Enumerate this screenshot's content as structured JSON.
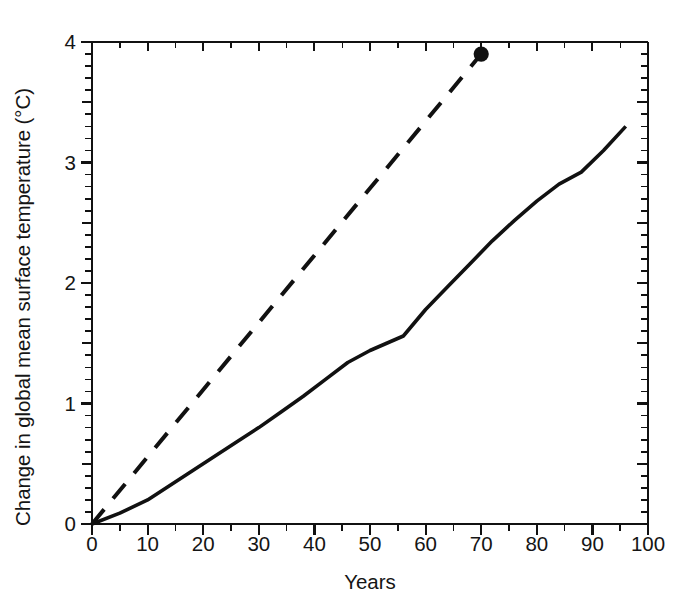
{
  "chart_data": {
    "type": "line",
    "title": "",
    "xlabel": "Years",
    "ylabel": "Change in global mean surface temperature (°C)",
    "xlim": [
      0,
      100
    ],
    "ylim": [
      0,
      4
    ],
    "xticks": [
      0,
      10,
      20,
      30,
      40,
      50,
      60,
      70,
      80,
      90,
      100
    ],
    "yticks": [
      0,
      1,
      2,
      3,
      4
    ],
    "xtick_labels": [
      "0",
      "10",
      "20",
      "30",
      "40",
      "50",
      "60",
      "70",
      "80",
      "90",
      "100"
    ],
    "ytick_labels": [
      "0",
      "1",
      "2",
      "3",
      "4"
    ],
    "x_minor_step": 5,
    "y_minor_step": 0.1,
    "grid": false,
    "legend": "none",
    "frame": "box",
    "line_color": "#111111",
    "background_color": "#ffffff",
    "series": [
      {
        "name": "dashed-projection",
        "style": "dashed",
        "marker": "filled-circle-at-end",
        "color": "#111111",
        "points": [
          [
            0,
            0.0
          ],
          [
            70,
            3.9
          ]
        ]
      },
      {
        "name": "solid-projection",
        "style": "solid",
        "marker": "none",
        "color": "#111111",
        "points": [
          [
            0,
            0.0
          ],
          [
            5,
            0.09
          ],
          [
            10,
            0.2
          ],
          [
            14,
            0.32
          ],
          [
            18,
            0.44
          ],
          [
            22,
            0.56
          ],
          [
            26,
            0.68
          ],
          [
            30,
            0.8
          ],
          [
            34,
            0.93
          ],
          [
            38,
            1.06
          ],
          [
            42,
            1.2
          ],
          [
            46,
            1.34
          ],
          [
            50,
            1.44
          ],
          [
            53,
            1.5
          ],
          [
            56,
            1.56
          ],
          [
            60,
            1.78
          ],
          [
            64,
            1.97
          ],
          [
            68,
            2.16
          ],
          [
            72,
            2.35
          ],
          [
            76,
            2.52
          ],
          [
            80,
            2.68
          ],
          [
            84,
            2.82
          ],
          [
            88,
            2.92
          ],
          [
            92,
            3.1
          ],
          [
            96,
            3.3
          ]
        ]
      }
    ],
    "annotations": [
      {
        "name": "endpoint-dot",
        "x": 70,
        "y": 3.9,
        "shape": "filled-circle"
      }
    ]
  },
  "axes_geometry": {
    "plot_left_px": 92,
    "plot_right_px": 648,
    "plot_top_px": 42,
    "plot_bottom_px": 524
  }
}
